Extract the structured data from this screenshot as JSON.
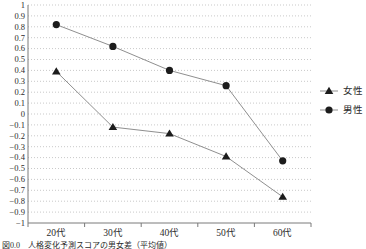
{
  "caption": "図0.0　人格変化予測スコアの男女差（平均値）",
  "colors": {
    "line": "#8f8f8f",
    "marker": "#1c1c1c",
    "grid": "#c9c9c9",
    "axis": "#7a7a7a",
    "text": "#2b2b2b"
  },
  "chart_data": {
    "type": "line",
    "title": "",
    "xlabel": "",
    "ylabel": "",
    "categories": [
      "20代",
      "30代",
      "40代",
      "50代",
      "60代"
    ],
    "series": [
      {
        "id": "female",
        "name": "女性",
        "marker": "triangle",
        "values": [
          0.39,
          -0.12,
          -0.18,
          -0.39,
          -0.76
        ]
      },
      {
        "id": "male",
        "name": "男性",
        "marker": "circle",
        "values": [
          0.82,
          0.62,
          0.4,
          0.26,
          -0.43
        ]
      }
    ],
    "ylim": [
      -1,
      1
    ],
    "ytick_step": 0.1,
    "grid": "horizontal-dotted",
    "legend_position": "right"
  }
}
